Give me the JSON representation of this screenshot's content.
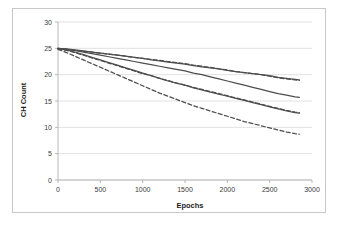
{
  "figure": {
    "background": "#ffffff",
    "frame_color": "#c8c8c8",
    "gridline_color": "#d9d9d9",
    "axis_color": "#b0b0b0",
    "series_color": "#4d4d4d"
  },
  "chart_data": {
    "type": "line",
    "title": "",
    "xlabel": "Epochs",
    "ylabel": "CH Count",
    "xlim": [
      0,
      3000
    ],
    "ylim": [
      0,
      30
    ],
    "xticks": [
      0,
      500,
      1000,
      1500,
      2000,
      2500,
      3000
    ],
    "yticks": [
      0,
      5,
      10,
      15,
      20,
      25,
      30
    ],
    "xtick_labels": [
      "0",
      "500",
      "1000",
      "1500",
      "2000",
      "2500",
      "3000"
    ],
    "ytick_labels": [
      "0",
      "5",
      "10",
      "15",
      "20",
      "25",
      "30"
    ],
    "grid": "horizontal",
    "legend": "none",
    "x": [
      0,
      100,
      200,
      300,
      400,
      500,
      600,
      700,
      800,
      900,
      1000,
      1100,
      1200,
      1300,
      1400,
      1500,
      1600,
      1700,
      1800,
      1900,
      2000,
      2100,
      2200,
      2300,
      2400,
      2500,
      2600,
      2700,
      2800,
      2850
    ],
    "series": [
      {
        "name": "series-1",
        "style": "solid",
        "color": "#4d4d4d",
        "values": [
          25.0,
          24.9,
          24.7,
          24.5,
          24.3,
          24.1,
          23.9,
          23.7,
          23.5,
          23.3,
          23.1,
          22.8,
          22.6,
          22.4,
          22.2,
          22.0,
          21.7,
          21.5,
          21.3,
          21.1,
          20.8,
          20.6,
          20.4,
          20.2,
          20.0,
          19.8,
          19.5,
          19.3,
          19.1,
          19.0
        ]
      },
      {
        "name": "series-2",
        "style": "dashed",
        "color": "#4d4d4d",
        "values": [
          24.9,
          24.8,
          24.6,
          24.4,
          24.3,
          24.1,
          23.9,
          23.7,
          23.5,
          23.3,
          23.1,
          22.9,
          22.7,
          22.5,
          22.3,
          22.1,
          21.8,
          21.6,
          21.4,
          21.1,
          20.9,
          20.6,
          20.4,
          20.2,
          20.0,
          19.7,
          19.4,
          19.2,
          19.0,
          18.9
        ]
      },
      {
        "name": "series-3",
        "style": "solid",
        "color": "#4d4d4d",
        "values": [
          25.0,
          24.8,
          24.6,
          24.3,
          24.0,
          23.7,
          23.4,
          23.1,
          22.8,
          22.5,
          22.2,
          21.9,
          21.6,
          21.3,
          21.0,
          20.7,
          20.3,
          20.0,
          19.6,
          19.2,
          18.8,
          18.4,
          18.0,
          17.6,
          17.2,
          16.8,
          16.4,
          16.1,
          15.8,
          15.7
        ]
      },
      {
        "name": "series-4",
        "style": "solid",
        "color": "#4d4d4d",
        "values": [
          25.0,
          24.7,
          24.3,
          23.8,
          23.3,
          22.8,
          22.3,
          21.8,
          21.3,
          20.8,
          20.3,
          19.8,
          19.3,
          18.8,
          18.4,
          18.0,
          17.5,
          17.1,
          16.7,
          16.3,
          15.9,
          15.5,
          15.1,
          14.7,
          14.3,
          13.9,
          13.5,
          13.1,
          12.8,
          12.7
        ]
      },
      {
        "name": "series-5",
        "style": "dashed",
        "color": "#4d4d4d",
        "values": [
          24.9,
          24.6,
          24.2,
          23.7,
          23.2,
          22.7,
          22.2,
          21.7,
          21.2,
          20.7,
          20.2,
          19.8,
          19.3,
          18.9,
          18.4,
          18.0,
          17.6,
          17.2,
          16.8,
          16.4,
          16.0,
          15.6,
          15.2,
          14.8,
          14.4,
          14.0,
          13.6,
          13.2,
          12.9,
          12.8
        ]
      },
      {
        "name": "series-6",
        "style": "dashed",
        "color": "#4d4d4d",
        "values": [
          24.8,
          24.2,
          23.5,
          22.8,
          22.1,
          21.4,
          20.7,
          20.0,
          19.3,
          18.6,
          17.9,
          17.2,
          16.5,
          15.9,
          15.3,
          14.7,
          14.1,
          13.6,
          13.1,
          12.6,
          12.1,
          11.6,
          11.1,
          10.7,
          10.3,
          9.9,
          9.5,
          9.1,
          8.8,
          8.7
        ]
      }
    ]
  }
}
